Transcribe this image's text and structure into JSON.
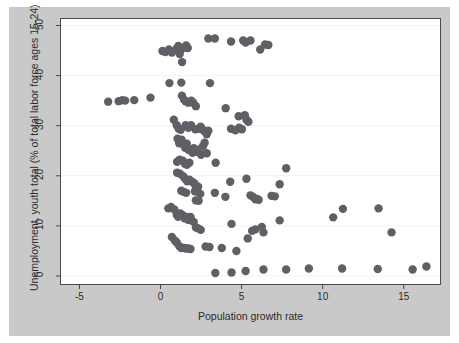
{
  "chart_data": {
    "type": "scatter",
    "title": "",
    "xlabel": "Population growth rate",
    "ylabel": "Unemployment, youth total (% of total labor force ages 15-24)",
    "xlim": [
      -6.2,
      17.3
    ],
    "ylim": [
      -1.8,
      51.5
    ],
    "xticks": [
      -5,
      0,
      5,
      10,
      15
    ],
    "xtick_labels": [
      "-5",
      "0",
      "5",
      "10",
      "15"
    ],
    "yticks": [
      0,
      10,
      20,
      30,
      40,
      50
    ],
    "ytick_labels": [
      "0",
      "10",
      "20",
      "30",
      "40",
      "50"
    ],
    "grid": "horizontal-light",
    "legend": "none",
    "marker": {
      "shape": "circle",
      "color": "#5f5f66",
      "size": 4.2
    },
    "series": [
      {
        "name": "countries",
        "points": [
          [
            -3.23,
            34.8
          ],
          [
            -2.58,
            34.9
          ],
          [
            -2.35,
            35.1
          ],
          [
            -2.18,
            35.0
          ],
          [
            -1.62,
            35.1
          ],
          [
            -0.62,
            35.6
          ],
          [
            0.12,
            44.9
          ],
          [
            0.3,
            44.7
          ],
          [
            0.52,
            45.2
          ],
          [
            0.7,
            44.6
          ],
          [
            1.0,
            45.4
          ],
          [
            1.1,
            45.9
          ],
          [
            1.18,
            44.3
          ],
          [
            1.25,
            45.1
          ],
          [
            1.33,
            42.7
          ],
          [
            1.52,
            45.6
          ],
          [
            1.58,
            46.0
          ],
          [
            1.68,
            45.5
          ],
          [
            2.95,
            47.4
          ],
          [
            3.35,
            47.4
          ],
          [
            4.35,
            46.8
          ],
          [
            5.1,
            47.0
          ],
          [
            5.25,
            46.6
          ],
          [
            5.55,
            47.0
          ],
          [
            6.15,
            45.2
          ],
          [
            6.45,
            46.2
          ],
          [
            6.65,
            46.1
          ],
          [
            0.55,
            38.5
          ],
          [
            1.28,
            38.6
          ],
          [
            3.05,
            38.5
          ],
          [
            1.32,
            36.0
          ],
          [
            1.45,
            35.2
          ],
          [
            1.55,
            34.9
          ],
          [
            1.72,
            34.6
          ],
          [
            1.9,
            35.0
          ],
          [
            2.02,
            34.6
          ],
          [
            2.18,
            33.9
          ],
          [
            4.02,
            33.5
          ],
          [
            4.82,
            31.9
          ],
          [
            5.2,
            32.1
          ],
          [
            5.3,
            31.2
          ],
          [
            5.42,
            30.8
          ],
          [
            4.35,
            29.4
          ],
          [
            4.62,
            29.1
          ],
          [
            4.85,
            29.6
          ],
          [
            5.02,
            29.3
          ],
          [
            0.82,
            31.2
          ],
          [
            1.0,
            30.1
          ],
          [
            1.12,
            29.4
          ],
          [
            1.25,
            29.2
          ],
          [
            1.55,
            30.1
          ],
          [
            1.72,
            29.6
          ],
          [
            1.88,
            30.1
          ],
          [
            2.15,
            29.3
          ],
          [
            2.35,
            29.4
          ],
          [
            2.48,
            29.8
          ],
          [
            2.6,
            29.2
          ],
          [
            2.72,
            28.9
          ],
          [
            2.85,
            28.3
          ],
          [
            2.95,
            29.0
          ],
          [
            1.05,
            27.4
          ],
          [
            1.15,
            26.5
          ],
          [
            1.3,
            27.2
          ],
          [
            1.42,
            26.2
          ],
          [
            1.52,
            25.6
          ],
          [
            1.62,
            26.4
          ],
          [
            1.72,
            25.2
          ],
          [
            1.88,
            25.0
          ],
          [
            1.98,
            24.6
          ],
          [
            2.05,
            25.5
          ],
          [
            2.2,
            24.8
          ],
          [
            2.35,
            25.2
          ],
          [
            2.5,
            24.2
          ],
          [
            2.62,
            25.9
          ],
          [
            2.72,
            26.6
          ],
          [
            2.85,
            24.5
          ],
          [
            1.02,
            22.8
          ],
          [
            1.18,
            23.2
          ],
          [
            1.38,
            23.0
          ],
          [
            1.5,
            22.4
          ],
          [
            1.62,
            22.2
          ],
          [
            1.78,
            22.6
          ],
          [
            3.4,
            22.6
          ],
          [
            7.75,
            21.5
          ],
          [
            1.02,
            20.6
          ],
          [
            1.2,
            20.4
          ],
          [
            1.4,
            19.9
          ],
          [
            1.52,
            19.4
          ],
          [
            1.65,
            18.9
          ],
          [
            1.78,
            19.2
          ],
          [
            1.95,
            18.8
          ],
          [
            2.08,
            18.5
          ],
          [
            2.18,
            18.0
          ],
          [
            2.32,
            17.8
          ],
          [
            4.3,
            18.8
          ],
          [
            5.3,
            19.4
          ],
          [
            7.35,
            18.3
          ],
          [
            1.28,
            17.0
          ],
          [
            1.42,
            16.8
          ],
          [
            1.58,
            16.6
          ],
          [
            2.12,
            16.9
          ],
          [
            2.28,
            16.8
          ],
          [
            2.45,
            16.4
          ],
          [
            2.18,
            15.1
          ],
          [
            2.35,
            15.0
          ],
          [
            3.35,
            16.6
          ],
          [
            4.0,
            15.8
          ],
          [
            5.55,
            16.1
          ],
          [
            5.7,
            15.8
          ],
          [
            5.85,
            15.3
          ],
          [
            5.95,
            15.4
          ],
          [
            6.05,
            15.2
          ],
          [
            6.85,
            16.0
          ],
          [
            7.05,
            15.9
          ],
          [
            10.65,
            11.7
          ],
          [
            11.25,
            13.4
          ],
          [
            13.45,
            13.5
          ],
          [
            14.25,
            8.7
          ],
          [
            0.48,
            13.5
          ],
          [
            0.65,
            13.8
          ],
          [
            0.85,
            13.3
          ],
          [
            1.0,
            12.2
          ],
          [
            1.08,
            11.8
          ],
          [
            1.22,
            12.5
          ],
          [
            1.35,
            12.2
          ],
          [
            1.48,
            11.5
          ],
          [
            1.6,
            11.8
          ],
          [
            1.7,
            11.2
          ],
          [
            1.85,
            11.8
          ],
          [
            1.95,
            11.0
          ],
          [
            2.05,
            10.8
          ],
          [
            2.18,
            9.7
          ],
          [
            2.32,
            9.5
          ],
          [
            2.48,
            9.2
          ],
          [
            4.38,
            10.4
          ],
          [
            5.38,
            7.5
          ],
          [
            5.65,
            9.0
          ],
          [
            5.85,
            9.3
          ],
          [
            6.25,
            9.8
          ],
          [
            6.35,
            8.7
          ],
          [
            7.35,
            11.1
          ],
          [
            0.7,
            7.8
          ],
          [
            0.88,
            7.1
          ],
          [
            1.0,
            6.7
          ],
          [
            1.15,
            6.0
          ],
          [
            1.28,
            5.6
          ],
          [
            1.45,
            5.6
          ],
          [
            1.58,
            5.5
          ],
          [
            1.72,
            5.5
          ],
          [
            1.85,
            5.4
          ],
          [
            2.78,
            5.9
          ],
          [
            3.02,
            5.8
          ],
          [
            3.78,
            5.6
          ],
          [
            4.68,
            5.0
          ],
          [
            3.38,
            0.6
          ],
          [
            4.38,
            0.7
          ],
          [
            5.25,
            1.0
          ],
          [
            6.35,
            1.3
          ],
          [
            7.75,
            1.3
          ],
          [
            9.15,
            1.5
          ],
          [
            11.2,
            1.5
          ],
          [
            13.4,
            1.4
          ],
          [
            15.55,
            1.3
          ],
          [
            16.4,
            1.9
          ]
        ]
      }
    ]
  },
  "axes": {
    "x_title": "Population growth rate",
    "y_title": "Unemployment, youth total (% of total labor force ages 15-24)",
    "x_tick_labels": [
      "-5",
      "0",
      "5",
      "10",
      "15"
    ],
    "y_tick_labels": [
      "0",
      "10",
      "20",
      "30",
      "40",
      "50"
    ]
  },
  "colors": {
    "marker": "#5f5f66",
    "plot_background": "#ffffff",
    "figure_background": "#c9c9c9",
    "page_background": "#ffffff",
    "axis_line": "#4a4a4a",
    "gridline": "#f2f2f2",
    "text": "#2b2b2b"
  }
}
